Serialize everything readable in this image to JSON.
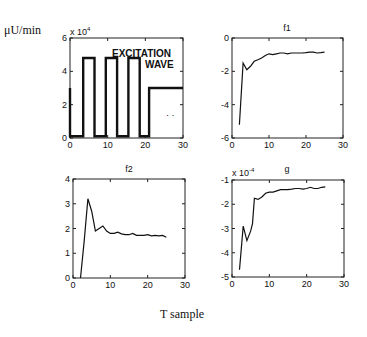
{
  "figure": {
    "ylabel": "μU/min",
    "xlabel": "T sample"
  },
  "chart_data": [
    {
      "type": "line",
      "title": "",
      "annotation": [
        "EXCITATION",
        "WAVE"
      ],
      "exponent_label": "x 10",
      "exponent_power": "4",
      "xlim": [
        0,
        30
      ],
      "ylim": [
        0,
        6
      ],
      "xticks": [
        "0",
        "10",
        "20",
        "30"
      ],
      "yticks": [
        "0",
        "2",
        "4",
        "6"
      ],
      "x": [
        0,
        0,
        0.5,
        3.5,
        3.5,
        6.5,
        6.5,
        9.5,
        9.5,
        12.5,
        12.5,
        15.5,
        15.5,
        18.5,
        18.5,
        21,
        21,
        30
      ],
      "values": [
        3,
        0.1,
        0.1,
        0.1,
        4.8,
        4.8,
        0.1,
        0.1,
        4.8,
        4.8,
        0.1,
        0.1,
        4.8,
        4.8,
        0.1,
        0.1,
        3,
        3
      ],
      "series_name": "excitation wave (x10^4 μU/min)"
    },
    {
      "type": "line",
      "title": "f1",
      "xlim": [
        0,
        30
      ],
      "ylim": [
        -6,
        0
      ],
      "xticks": [
        "0",
        "10",
        "20",
        "30"
      ],
      "yticks": [
        "0",
        "-2",
        "-4",
        "-6"
      ],
      "x": [
        2,
        3,
        4,
        5,
        6,
        7,
        8,
        9,
        10,
        11,
        12,
        13,
        14,
        15,
        16,
        17,
        18,
        19,
        20,
        21,
        22,
        23,
        24,
        25
      ],
      "values": [
        -5.2,
        -1.5,
        -1.9,
        -1.7,
        -1.4,
        -1.3,
        -1.2,
        -1.05,
        -0.95,
        -1.0,
        -0.95,
        -0.9,
        -0.9,
        -0.95,
        -0.9,
        -0.9,
        -0.9,
        -0.9,
        -0.88,
        -0.85,
        -0.85,
        -0.9,
        -0.88,
        -0.85
      ]
    },
    {
      "type": "line",
      "title": "f2",
      "xlim": [
        0,
        30
      ],
      "ylim": [
        0,
        4
      ],
      "xticks": [
        "0",
        "10",
        "20",
        "30"
      ],
      "yticks": [
        "0",
        "1",
        "2",
        "3",
        "4"
      ],
      "x": [
        2,
        3,
        4,
        5,
        6,
        7,
        8,
        9,
        10,
        11,
        12,
        13,
        14,
        15,
        16,
        17,
        18,
        19,
        20,
        21,
        22,
        23,
        24,
        25
      ],
      "values": [
        0,
        1.5,
        3.2,
        2.7,
        1.9,
        2.0,
        2.1,
        1.9,
        1.8,
        1.8,
        1.85,
        1.78,
        1.75,
        1.75,
        1.8,
        1.72,
        1.72,
        1.72,
        1.75,
        1.7,
        1.72,
        1.7,
        1.72,
        1.65
      ]
    },
    {
      "type": "line",
      "title": "g",
      "exponent_label": "x 10",
      "exponent_power": "-4",
      "xlim": [
        0,
        30
      ],
      "ylim": [
        -5,
        -1
      ],
      "xticks": [
        "0",
        "10",
        "20",
        "30"
      ],
      "yticks": [
        "-1",
        "-2",
        "-3",
        "-4",
        "-5"
      ],
      "x": [
        2,
        3,
        4,
        5,
        5.5,
        6,
        7,
        8,
        9,
        10,
        11,
        12,
        13,
        14,
        15,
        16,
        17,
        18,
        19,
        20,
        21,
        22,
        23,
        24,
        25
      ],
      "values": [
        -4.7,
        -2.9,
        -3.5,
        -3.1,
        -2.8,
        -1.75,
        -1.8,
        -1.7,
        -1.55,
        -1.5,
        -1.5,
        -1.45,
        -1.4,
        -1.4,
        -1.4,
        -1.38,
        -1.35,
        -1.35,
        -1.38,
        -1.35,
        -1.3,
        -1.35,
        -1.35,
        -1.3,
        -1.28
      ]
    }
  ]
}
